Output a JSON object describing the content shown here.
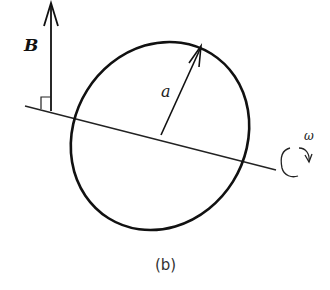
{
  "figure": {
    "caption": "(b)",
    "labels": {
      "magnetic_field": "B",
      "radius": "a",
      "angular_velocity": "ω"
    },
    "elements": [
      "magnetic-field-vector-B",
      "rotation-axis",
      "right-angle-marker",
      "rotating-loop",
      "radius-arrow-a",
      "rotation-arrow-omega"
    ],
    "colors": {
      "stroke": "#111111",
      "background": "#ffffff"
    }
  }
}
